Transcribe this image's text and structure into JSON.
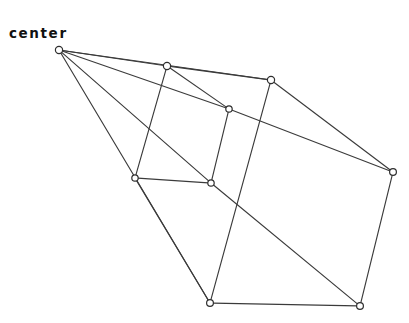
{
  "diagram": {
    "type": "node-link-graph",
    "background_color": "#ffffff",
    "edge_color": "#3b3b3b",
    "node_fill_color": "#ffffff",
    "node_stroke_color": "#2e2e2e",
    "label_color": "#111111",
    "width": 409,
    "height": 323,
    "labels": [
      {
        "id": "center-label",
        "text": "center",
        "x": 9,
        "y": 27
      }
    ],
    "nodes": [
      {
        "id": "n0",
        "name": "center",
        "x": 59,
        "y": 50,
        "r": 3.6
      },
      {
        "id": "n1",
        "name": "top-middle",
        "x": 167,
        "y": 66,
        "r": 3.6
      },
      {
        "id": "n2",
        "name": "top-right",
        "x": 271,
        "y": 80,
        "r": 3.6
      },
      {
        "id": "n3",
        "name": "mid-upper",
        "x": 229,
        "y": 109,
        "r": 3.2
      },
      {
        "id": "n4",
        "name": "right",
        "x": 393,
        "y": 172,
        "r": 3.4
      },
      {
        "id": "n5",
        "name": "mid-left",
        "x": 135,
        "y": 178,
        "r": 3.2
      },
      {
        "id": "n6",
        "name": "mid-center",
        "x": 211,
        "y": 183,
        "r": 3.2
      },
      {
        "id": "n7",
        "name": "bottom-center",
        "x": 210,
        "y": 303,
        "r": 3.4
      },
      {
        "id": "n8",
        "name": "bottom-right",
        "x": 360,
        "y": 306,
        "r": 3.4
      }
    ],
    "edges": [
      {
        "id": "e0",
        "from": "n0",
        "to": "n1",
        "name": "center-to-top-middle"
      },
      {
        "id": "e1",
        "from": "n0",
        "to": "n2",
        "name": "center-to-top-right"
      },
      {
        "id": "e2",
        "from": "n0",
        "to": "n3",
        "name": "center-to-mid-upper"
      },
      {
        "id": "e3",
        "from": "n0",
        "to": "n6",
        "name": "center-to-mid-center"
      },
      {
        "id": "e4",
        "from": "n0",
        "to": "n7",
        "name": "center-to-bottom-center"
      },
      {
        "id": "e5",
        "from": "n1",
        "to": "n2",
        "name": "top-middle-to-top-right"
      },
      {
        "id": "e6",
        "from": "n1",
        "to": "n3",
        "name": "top-middle-to-mid-upper"
      },
      {
        "id": "e7",
        "from": "n1",
        "to": "n5",
        "name": "top-middle-to-mid-left"
      },
      {
        "id": "e8",
        "from": "n2",
        "to": "n4",
        "name": "top-right-to-right"
      },
      {
        "id": "e9",
        "from": "n2",
        "to": "n7",
        "name": "top-right-to-bottom-center"
      },
      {
        "id": "e10",
        "from": "n3",
        "to": "n4",
        "name": "mid-upper-to-right"
      },
      {
        "id": "e11",
        "from": "n3",
        "to": "n6",
        "name": "mid-upper-to-mid-center"
      },
      {
        "id": "e12",
        "from": "n4",
        "to": "n8",
        "name": "right-to-bottom-right"
      },
      {
        "id": "e13",
        "from": "n5",
        "to": "n6",
        "name": "mid-left-to-mid-center"
      },
      {
        "id": "e14",
        "from": "n5",
        "to": "n7",
        "name": "mid-left-to-bottom-center"
      },
      {
        "id": "e15",
        "from": "n6",
        "to": "n8",
        "name": "mid-center-to-bottom-right"
      },
      {
        "id": "e16",
        "from": "n7",
        "to": "n8",
        "name": "bottom-center-to-bottom-right"
      }
    ]
  }
}
